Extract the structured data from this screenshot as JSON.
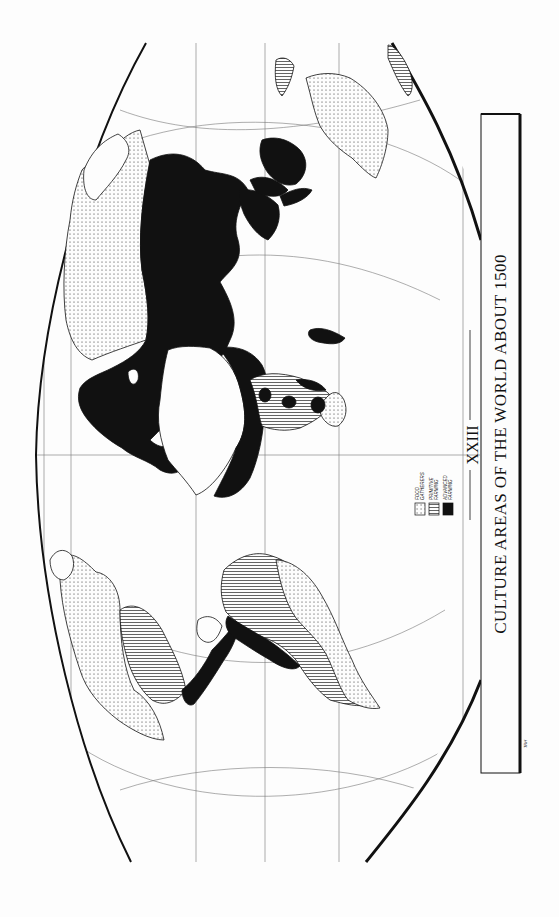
{
  "map": {
    "plate_number": "XXIII",
    "title": "CULTURE AREAS OF THE WORLD ABOUT 1500",
    "credit": "TRH",
    "orientation": "rotated 90° counter-clockwise on page",
    "colors": {
      "paper": "#fdfdfd",
      "ink": "#111111",
      "graticule": "#777777"
    },
    "legend": {
      "items": [
        {
          "id": "food-gatherers",
          "line1": "FOOD",
          "line2": "GATHERERS",
          "pattern": "dots"
        },
        {
          "id": "primitive-farming",
          "line1": "PRIMITIVE",
          "line2": "FARMING",
          "pattern": "lines"
        },
        {
          "id": "advanced-farming",
          "line1": "ADVANCED",
          "line2": "FARMING",
          "pattern": "solid"
        }
      ]
    },
    "regions": [
      {
        "name": "North America",
        "culture": [
          "food gatherers",
          "primitive farming"
        ]
      },
      {
        "name": "Mesoamerica / Andes",
        "culture": [
          "advanced farming"
        ]
      },
      {
        "name": "South America",
        "culture": [
          "primitive farming",
          "food gatherers"
        ]
      },
      {
        "name": "Europe / Asia / North Africa",
        "culture": [
          "advanced farming"
        ]
      },
      {
        "name": "Siberia",
        "culture": [
          "food gatherers"
        ]
      },
      {
        "name": "Sub-Saharan Africa",
        "culture": [
          "primitive farming",
          "advanced farming",
          "food gatherers"
        ]
      },
      {
        "name": "Australia",
        "culture": [
          "food gatherers"
        ]
      }
    ]
  }
}
